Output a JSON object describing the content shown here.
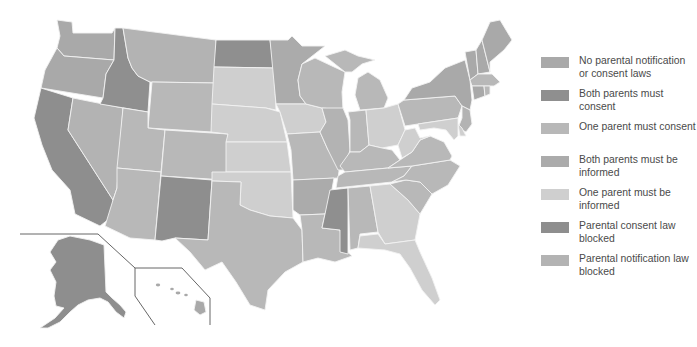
{
  "map": {
    "title": "Parental involvement laws for minors seeking abortion, by state",
    "colors": {
      "none": "#a9a9a9",
      "both_consent": "#8f8f8f",
      "one_consent": "#b8b8b8",
      "both_informed": "#ababab",
      "one_informed": "#cfcfcf",
      "consent_blocked": "#8e8e8e",
      "notification_blocked": "#b3b3b3",
      "border": "#f2f2f2",
      "inset_lines": "#555555"
    },
    "states": {
      "WA": "none",
      "OR": "none",
      "CA": "consent_blocked",
      "NV": "notification_blocked",
      "ID": "both_consent",
      "MT": "notification_blocked",
      "WY": "one_consent",
      "UT": "one_consent",
      "AZ": "one_consent",
      "CO": "one_consent",
      "NM": "consent_blocked",
      "ND": "both_consent",
      "SD": "one_informed",
      "NE": "one_informed",
      "KS": "one_informed",
      "OK": "one_informed",
      "TX": "one_consent",
      "MN": "both_informed",
      "IA": "one_informed",
      "MO": "one_consent",
      "AR": "both_informed",
      "LA": "one_consent",
      "WI": "one_consent",
      "IL": "notification_blocked",
      "MI": "one_consent",
      "IN": "one_consent",
      "KY": "one_consent",
      "TN": "one_consent",
      "MS": "both_consent",
      "AL": "one_consent",
      "GA": "one_informed",
      "FL": "one_informed",
      "OH": "one_informed",
      "WV": "one_informed",
      "VA": "one_consent",
      "NC": "one_consent",
      "SC": "one_consent",
      "PA": "one_consent",
      "NY": "none",
      "VT": "none",
      "NH": "none",
      "ME": "none",
      "MA": "one_consent",
      "RI": "one_consent",
      "CT": "none",
      "NJ": "notification_blocked",
      "DE": "one_informed",
      "MD": "one_informed",
      "AK": "consent_blocked",
      "HI": "none"
    }
  },
  "legend": {
    "items": [
      {
        "key": "none",
        "label": "No parental notification or consent laws",
        "color": "#a9a9a9"
      },
      {
        "key": "both_consent",
        "label": "Both parents must consent",
        "color": "#8f8f8f"
      },
      {
        "key": "one_consent",
        "label": "One parent must consent",
        "color": "#b8b8b8"
      },
      {
        "key": "both_informed",
        "label": "Both parents must be informed",
        "color": "#ababab"
      },
      {
        "key": "one_informed",
        "label": "One parent must be informed",
        "color": "#cfcfcf"
      },
      {
        "key": "consent_blocked",
        "label": "Parental consent law blocked",
        "color": "#8e8e8e"
      },
      {
        "key": "notification_blocked",
        "label": "Parental notification law blocked",
        "color": "#b3b3b3"
      }
    ]
  }
}
